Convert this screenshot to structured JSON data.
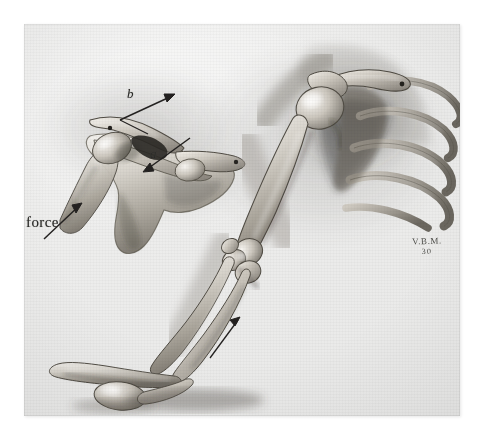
{
  "plate": {
    "title": "Shoulder girdle and upper limb — anatomical illustration",
    "medium": "grayscale wash / airbrush medical illustration",
    "paper_color": "#eeeeed",
    "ink_color": "#2a2a28",
    "background_color": "#ffffff"
  },
  "figures": [
    {
      "id": "figure-superior-view",
      "name": "superior view of shoulder girdle",
      "description": "Scapula, clavicle, acromion and humeral head seen from above, with force vectors",
      "structures": [
        "clavicle",
        "acromion",
        "scapular spine",
        "coracoid process",
        "humeral head",
        "scapula body",
        "glenoid"
      ]
    },
    {
      "id": "figure-anterior-arm",
      "name": "anterior view of right upper limb",
      "description": "Shoulder joint with clavicle, scapula, humerus, ribs, elbow joint, radius, ulna and hand resting on a surface",
      "structures": [
        "clavicle",
        "acromion",
        "humerus",
        "ribs",
        "scapula",
        "elbow joint",
        "radius",
        "ulna",
        "carpus",
        "hand"
      ]
    }
  ],
  "annotations": {
    "force_label": "force",
    "vector_a_label": "a",
    "vector_b_label": "b",
    "arrows": [
      {
        "name": "force-arrow",
        "points_to": "humerus shaft, superior view",
        "direction": "up-right"
      },
      {
        "name": "vector-b-arrow",
        "points_to": "clavicle, lateral end",
        "direction": "up-right"
      },
      {
        "name": "vector-a-arrow",
        "points_to": "acromioclavicular region",
        "direction": "down-left"
      },
      {
        "name": "forearm-arrow",
        "points_to": "proximal forearm, anterior view",
        "direction": "up-right"
      }
    ]
  },
  "signature": {
    "artist_initials": "V.B.M.",
    "year": "30"
  }
}
